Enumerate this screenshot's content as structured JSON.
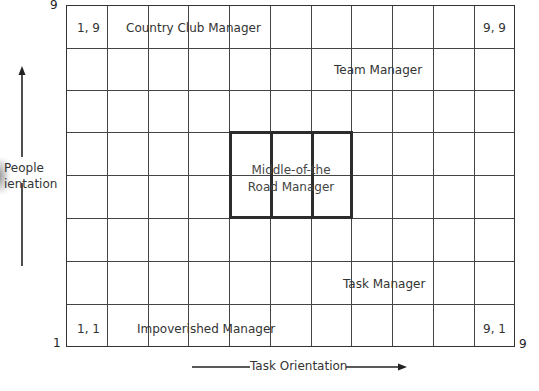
{
  "diagram": {
    "grid": {
      "columns": 11,
      "rows": 8
    },
    "y_axis": {
      "label_line1": "People",
      "label_line2": "ientation",
      "min_label": "1",
      "max_label": "9"
    },
    "x_axis": {
      "label": "Task Orientation",
      "max_label": "9"
    },
    "cells": {
      "top_left_coord": "1, 9",
      "top_right_coord": "9, 9",
      "bottom_left_coord": "1, 1",
      "bottom_right_coord": "9, 1"
    },
    "styles": {
      "country_club": "Country Club Manager",
      "team": "Team Manager",
      "middle_line1": "Middle-of-the",
      "middle_line2": "Road Manager",
      "task": "Task Manager",
      "impoverished": "Impoverished Manager"
    },
    "colors": {
      "grid_line": "#444444",
      "bold_box": "#2c2c2c",
      "text": "#333333",
      "background": "#ffffff"
    }
  }
}
